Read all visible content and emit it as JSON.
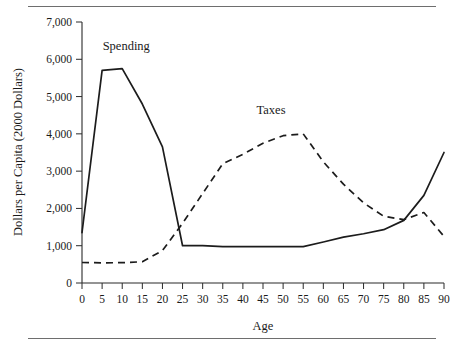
{
  "figure": {
    "background_color": "#ffffff",
    "rule_color": "#6e6e6e",
    "line_color": "#1c1c1c"
  },
  "chart_data": {
    "type": "line",
    "title": "",
    "subtitle": "",
    "xlabel": "Age",
    "ylabel": "Dollars per Capita (2000 Dollars)",
    "xlim": [
      0,
      90
    ],
    "ylim": [
      0,
      7000
    ],
    "grid": false,
    "legend_position": "inline-annotations",
    "x_tick_labels": [
      "0",
      "5",
      "10",
      "15",
      "20",
      "25",
      "30",
      "35",
      "40",
      "45",
      "50",
      "55",
      "60",
      "65",
      "70",
      "75",
      "80",
      "85",
      "90"
    ],
    "x_ticks": [
      0,
      5,
      10,
      15,
      20,
      25,
      30,
      35,
      40,
      45,
      50,
      55,
      60,
      65,
      70,
      75,
      80,
      85,
      90
    ],
    "y_tick_labels": [
      "0",
      "1,000",
      "2,000",
      "3,000",
      "4,000",
      "5,000",
      "6,000",
      "7,000"
    ],
    "y_ticks": [
      0,
      1000,
      2000,
      3000,
      4000,
      5000,
      6000,
      7000
    ],
    "x": [
      0,
      5,
      10,
      15,
      20,
      25,
      30,
      35,
      40,
      45,
      50,
      55,
      60,
      65,
      70,
      75,
      80,
      85,
      90
    ],
    "series": [
      {
        "name": "Spending",
        "style": "solid",
        "label_x": 11,
        "label_y": 6250,
        "values": [
          1350,
          5700,
          5750,
          4800,
          3650,
          1000,
          1000,
          975,
          975,
          975,
          975,
          975,
          1100,
          1230,
          1320,
          1430,
          1680,
          2350,
          3500
        ]
      },
      {
        "name": "Taxes",
        "style": "dashed",
        "label_x": 47,
        "label_y": 4520,
        "values": [
          550,
          540,
          545,
          570,
          870,
          1600,
          2400,
          3200,
          3450,
          3750,
          3950,
          4000,
          3250,
          2650,
          2150,
          1790,
          1700,
          1890,
          1250
        ]
      }
    ],
    "annotations": [
      {
        "text": "Spending",
        "x": 11,
        "y": 6250
      },
      {
        "text": "Taxes",
        "x": 47,
        "y": 4520
      }
    ]
  }
}
